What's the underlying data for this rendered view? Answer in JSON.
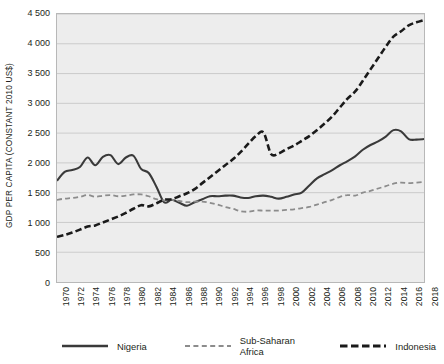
{
  "chart_data": {
    "type": "line",
    "title": "",
    "xlabel": "",
    "ylabel": "GDP PER CAPITA (CONSTANT 2010 US$)",
    "ylim": [
      0,
      4500
    ],
    "ytick_labels": [
      "0",
      "500",
      "1 000",
      "1 500",
      "2 000",
      "2 500",
      "3 000",
      "3 500",
      "4 000",
      "4 500"
    ],
    "ytick_values": [
      0,
      500,
      1000,
      1500,
      2000,
      2500,
      3000,
      3500,
      4000,
      4500
    ],
    "grid": true,
    "legend_position": "bottom",
    "xlim": [
      1970,
      2018
    ],
    "categories": [
      "1970",
      "1971",
      "1972",
      "1973",
      "1974",
      "1975",
      "1976",
      "1977",
      "1978",
      "1979",
      "1980",
      "1981",
      "1982",
      "1983",
      "1984",
      "1985",
      "1986",
      "1987",
      "1988",
      "1989",
      "1990",
      "1991",
      "1992",
      "1993",
      "1994",
      "1995",
      "1996",
      "1997",
      "1998",
      "1999",
      "2000",
      "2001",
      "2002",
      "2003",
      "2004",
      "2005",
      "2006",
      "2007",
      "2008",
      "2009",
      "2010",
      "2011",
      "2012",
      "2013",
      "2014",
      "2015",
      "2016",
      "2017",
      "2018"
    ],
    "xtick_labels": [
      "1970",
      "1972",
      "1974",
      "1976",
      "1978",
      "1980",
      "1982",
      "1984",
      "1986",
      "1988",
      "1990",
      "1992",
      "1994",
      "1996",
      "1998",
      "2000",
      "2002",
      "2004",
      "2006",
      "2008",
      "2010",
      "2012",
      "2014",
      "2016",
      "2018"
    ],
    "series": [
      {
        "name": "Nigeria",
        "style": "solid",
        "color": "#3a3a3a",
        "values": [
          1700,
          1850,
          1880,
          1930,
          2090,
          1960,
          2100,
          2130,
          1980,
          2090,
          2120,
          1900,
          1830,
          1600,
          1340,
          1380,
          1330,
          1280,
          1340,
          1390,
          1440,
          1440,
          1450,
          1450,
          1420,
          1410,
          1440,
          1450,
          1430,
          1400,
          1430,
          1470,
          1500,
          1620,
          1740,
          1810,
          1880,
          1960,
          2030,
          2110,
          2220,
          2300,
          2360,
          2440,
          2550,
          2530,
          2400,
          2390,
          2400
        ]
      },
      {
        "name": "Sub-Saharan Africa",
        "style": "dashed-light",
        "color": "#8c8c8c",
        "values": [
          1380,
          1400,
          1410,
          1430,
          1460,
          1430,
          1450,
          1460,
          1440,
          1450,
          1470,
          1470,
          1440,
          1390,
          1370,
          1380,
          1360,
          1340,
          1350,
          1350,
          1330,
          1300,
          1260,
          1230,
          1190,
          1180,
          1200,
          1200,
          1200,
          1200,
          1210,
          1220,
          1240,
          1260,
          1300,
          1340,
          1380,
          1430,
          1460,
          1450,
          1500,
          1530,
          1570,
          1610,
          1650,
          1670,
          1660,
          1670,
          1680
        ]
      },
      {
        "name": "Indonesia",
        "style": "dashed-bold",
        "color": "#1a1a1a",
        "values": [
          760,
          790,
          830,
          880,
          930,
          950,
          1000,
          1050,
          1100,
          1160,
          1230,
          1290,
          1270,
          1320,
          1380,
          1390,
          1440,
          1490,
          1560,
          1660,
          1760,
          1860,
          1960,
          2060,
          2180,
          2320,
          2450,
          2510,
          2150,
          2160,
          2230,
          2290,
          2370,
          2450,
          2550,
          2660,
          2780,
          2930,
          3080,
          3200,
          3380,
          3570,
          3760,
          3950,
          4120,
          4210,
          4310,
          4360,
          4400
        ]
      }
    ]
  },
  "legend": {
    "items": [
      {
        "label": "Nigeria"
      },
      {
        "label": "Sub-Saharan Africa"
      },
      {
        "label": "Indonesia"
      }
    ]
  }
}
